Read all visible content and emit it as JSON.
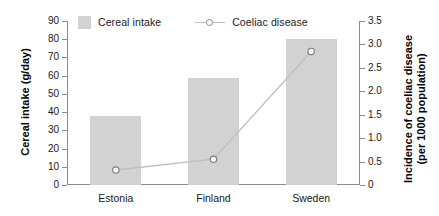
{
  "chart_data": {
    "type": "bar",
    "title": "",
    "subtitle": "",
    "categories": [
      "Estonia",
      "Finland",
      "Sweden"
    ],
    "series": [
      {
        "name": "Cereal intake",
        "type": "bar",
        "axis": "left",
        "unit": "g/day",
        "values": [
          38,
          59,
          80
        ],
        "color": "#d2d2d2"
      },
      {
        "name": "Coeliac disease",
        "type": "line",
        "axis": "right",
        "unit": "per 1000 population",
        "values": [
          0.32,
          0.55,
          2.85
        ],
        "color": "#bfbfbf",
        "marker": "open-circle"
      }
    ],
    "xlabel": "",
    "ylabel": "Cereal intake (g/day)",
    "y2label": "Incidence of coeliac disease (per 1000 population)",
    "ylim": [
      0,
      90
    ],
    "y2lim": [
      0,
      3.5
    ],
    "ytick_step": 10,
    "y2tick_step": 0.5,
    "grid": false,
    "legend_position": "top"
  },
  "axes": {
    "left": {
      "title": "Cereal intake (g/day)",
      "ticks": [
        "90",
        "80",
        "70",
        "60",
        "50",
        "40",
        "30",
        "20",
        "10",
        "0"
      ]
    },
    "right": {
      "title_line1": "Incidence of coeliac disease",
      "title_line2": "(per 1000 population)",
      "ticks": [
        "3.5",
        "3.0",
        "2.5",
        "2.0",
        "1.5",
        "1.0",
        "0.5",
        "0"
      ]
    },
    "categories": [
      "Estonia",
      "Finland",
      "Sweden"
    ]
  },
  "legend": {
    "items": [
      {
        "label": "Cereal intake"
      },
      {
        "label": "Coeliac disease"
      }
    ]
  }
}
